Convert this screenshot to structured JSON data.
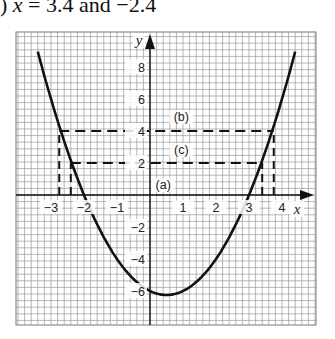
{
  "caption": {
    "prefix": ")",
    "var": "x",
    "text": " = 3.4 and −2.4"
  },
  "chart_data": {
    "type": "line",
    "title": "",
    "function": "y = x^2 - x - 6",
    "xlabel": "x",
    "ylabel": "y",
    "xlim": [
      -3.5,
      4.5
    ],
    "ylim": [
      -7.8,
      10
    ],
    "grid": true,
    "x_ticks": [
      -3,
      -2,
      -1,
      1,
      2,
      3,
      4
    ],
    "x_tick_labels": [
      "−3",
      "−2",
      "−1",
      "1",
      "2",
      "3",
      "4"
    ],
    "y_ticks": [
      8,
      6,
      4,
      2,
      -2,
      -4,
      -6
    ],
    "y_tick_labels": [
      "8",
      "6",
      "4",
      "2",
      "−2",
      "−4",
      "−6"
    ],
    "series": [
      {
        "name": "y = x² − x − 6",
        "x": [
          -3.4,
          -3,
          -2.5,
          -2,
          -1.5,
          -1,
          -0.5,
          0,
          0.5,
          1,
          1.5,
          2,
          2.5,
          3,
          3.5,
          4,
          4.4
        ],
        "y": [
          8.96,
          6,
          2.75,
          0,
          -2.25,
          -4,
          -5.25,
          -6,
          -6.25,
          -6,
          -5.25,
          -4,
          -2.25,
          0,
          2.75,
          6,
          8.96
        ]
      }
    ],
    "horizontal_lines": [
      {
        "label": "(a)",
        "y": 0,
        "style": "solid"
      },
      {
        "label": "(b)",
        "y": 4,
        "style": "dashed",
        "x_from": -2.75,
        "x_to": 3.75
      },
      {
        "label": "(c)",
        "y": 2,
        "style": "dashed",
        "x_from": -2.4,
        "x_to": 3.4
      }
    ],
    "vertical_dashed": [
      {
        "x": -2.75,
        "y_from": 0,
        "y_to": 4
      },
      {
        "x": 3.75,
        "y_from": 0,
        "y_to": 4
      },
      {
        "x": -2.4,
        "y_from": 0,
        "y_to": 2
      },
      {
        "x": 3.4,
        "y_from": 0,
        "y_to": 2
      }
    ],
    "annotations": [
      "(a)",
      "(b)",
      "(c)"
    ]
  }
}
